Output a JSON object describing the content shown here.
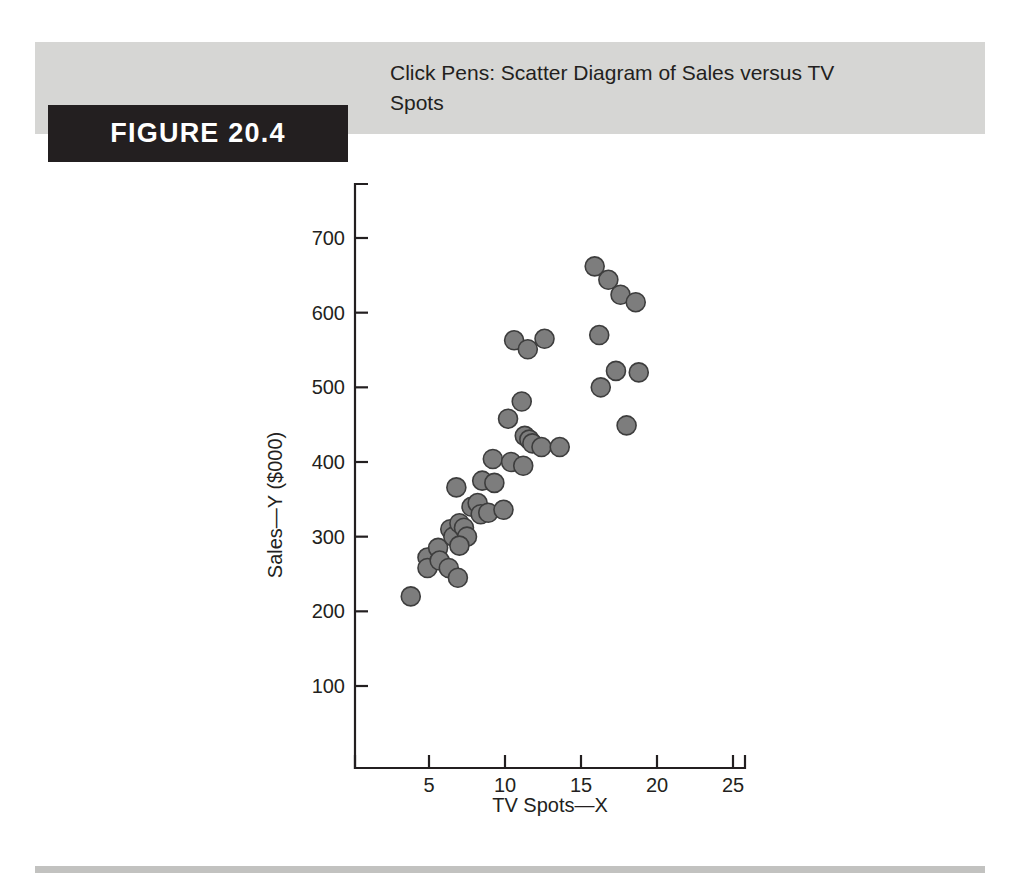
{
  "figure": {
    "tag": "FIGURE 20.4",
    "title": "Click Pens: Scatter Diagram of Sales versus TV Spots"
  },
  "colors": {
    "header_band": "#d6d6d4",
    "tag_background": "#231f20",
    "tag_text": "#ffffff",
    "axis": "#231f20",
    "marker_fill": "#7d7d7d",
    "marker_stroke": "#3d3d3d",
    "footer_rule": "#c2c2c0"
  },
  "chart_data": {
    "type": "scatter",
    "title": "Click Pens: Scatter Diagram of Sales versus TV Spots",
    "xlabel": "TV Spots—X",
    "ylabel": "Sales—Y ($000)",
    "xlim": [
      0,
      25
    ],
    "ylim": [
      0,
      760
    ],
    "xticks": [
      5,
      10,
      15,
      20,
      25
    ],
    "yticks": [
      100,
      200,
      300,
      400,
      500,
      600,
      700
    ],
    "xtick_labels": [
      "5",
      "10",
      "15",
      "20",
      "25"
    ],
    "ytick_labels": [
      "100",
      "200",
      "300",
      "400",
      "500",
      "600",
      "700"
    ],
    "grid": false,
    "legend": false,
    "marker": "filled-circle",
    "points": [
      {
        "x": 3.8,
        "y": 220
      },
      {
        "x": 4.9,
        "y": 272
      },
      {
        "x": 4.9,
        "y": 258
      },
      {
        "x": 5.6,
        "y": 285
      },
      {
        "x": 5.7,
        "y": 268
      },
      {
        "x": 6.3,
        "y": 258
      },
      {
        "x": 6.9,
        "y": 245
      },
      {
        "x": 6.4,
        "y": 310
      },
      {
        "x": 6.6,
        "y": 300
      },
      {
        "x": 7.0,
        "y": 318
      },
      {
        "x": 7.3,
        "y": 312
      },
      {
        "x": 7.5,
        "y": 300
      },
      {
        "x": 7.0,
        "y": 288
      },
      {
        "x": 6.8,
        "y": 366
      },
      {
        "x": 7.8,
        "y": 340
      },
      {
        "x": 8.2,
        "y": 345
      },
      {
        "x": 8.4,
        "y": 330
      },
      {
        "x": 8.9,
        "y": 332
      },
      {
        "x": 8.5,
        "y": 375
      },
      {
        "x": 9.3,
        "y": 372
      },
      {
        "x": 9.9,
        "y": 336
      },
      {
        "x": 9.2,
        "y": 404
      },
      {
        "x": 10.4,
        "y": 400
      },
      {
        "x": 10.2,
        "y": 458
      },
      {
        "x": 11.1,
        "y": 481
      },
      {
        "x": 11.3,
        "y": 435
      },
      {
        "x": 11.6,
        "y": 430
      },
      {
        "x": 11.8,
        "y": 425
      },
      {
        "x": 12.4,
        "y": 420
      },
      {
        "x": 11.2,
        "y": 395
      },
      {
        "x": 13.6,
        "y": 420
      },
      {
        "x": 10.6,
        "y": 563
      },
      {
        "x": 11.5,
        "y": 551
      },
      {
        "x": 12.6,
        "y": 565
      },
      {
        "x": 15.9,
        "y": 662
      },
      {
        "x": 16.8,
        "y": 644
      },
      {
        "x": 17.6,
        "y": 624
      },
      {
        "x": 18.6,
        "y": 614
      },
      {
        "x": 16.2,
        "y": 570
      },
      {
        "x": 17.3,
        "y": 522
      },
      {
        "x": 18.8,
        "y": 520
      },
      {
        "x": 16.3,
        "y": 500
      },
      {
        "x": 18.0,
        "y": 449
      }
    ]
  },
  "axis": {
    "y_title": "Sales—Y ($000)",
    "x_title": "TV Spots—X"
  }
}
